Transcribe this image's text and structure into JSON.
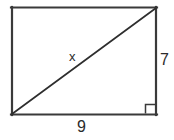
{
  "figure": {
    "type": "geometry-diagram",
    "shape": "rectangle-with-diagonal",
    "background_color": "#ffffff",
    "stroke_color": "#3a3a3a",
    "diagonal_color": "#2e2e2e",
    "labels": {
      "hypotenuse": "x",
      "right_side": "7",
      "bottom_side": "9"
    },
    "right_angle_marker": {
      "present": true,
      "corner": "bottom-right"
    },
    "geometry": {
      "rect_left": 11,
      "rect_top": 7,
      "rect_right": 157,
      "rect_bottom": 115,
      "diagonal_from": "bottom-left",
      "diagonal_to": "top-right",
      "marker_size": 10
    }
  }
}
